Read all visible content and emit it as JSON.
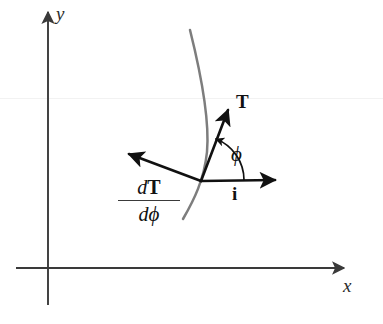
{
  "figure": {
    "background_color": "#ffffff",
    "width": 383,
    "height": 324
  },
  "axes": {
    "color": "#3a3a3a",
    "x_axis": {
      "label": "x",
      "name": "x-axis",
      "start": [
        16,
        268
      ],
      "end": [
        348,
        268
      ]
    },
    "y_axis": {
      "label": "y",
      "name": "y-axis",
      "start": [
        48,
        305
      ],
      "end": [
        48,
        8
      ]
    }
  },
  "curve": {
    "name": "path-curve",
    "color": "#7d7d7d",
    "description": "gray curved path through the point of tangency"
  },
  "origin_point": {
    "x": 201,
    "y": 181,
    "label": "point of tangency"
  },
  "vectors": [
    {
      "id": "tangent",
      "label": "T",
      "style": "bold",
      "color": "#111111",
      "from": [
        201,
        181
      ],
      "to": [
        231,
        104
      ],
      "label_pos": [
        236,
        92
      ],
      "description": "unit tangent vector"
    },
    {
      "id": "derivative",
      "label": "dT/dphi",
      "numerator_d": "d",
      "numerator_sym": "T",
      "denominator_d": "d",
      "denominator_sym": "ϕ",
      "style": "fraction",
      "color": "#111111",
      "from": [
        201,
        181
      ],
      "to": [
        124,
        152
      ],
      "label_pos": [
        127,
        178
      ],
      "description": "derivative of T with respect to phi"
    },
    {
      "id": "unit-i",
      "label": "i",
      "style": "bold",
      "color": "#111111",
      "from": [
        201,
        181
      ],
      "to": [
        281,
        180
      ],
      "label_pos": [
        232,
        184
      ],
      "description": "unit vector i along x"
    }
  ],
  "angle": {
    "id": "phi-angle",
    "symbol": "ϕ",
    "label_pos": [
      231,
      144
    ],
    "between": [
      "unit-i",
      "tangent"
    ],
    "arc_color": "#111111",
    "description": "angle phi from i to T"
  }
}
